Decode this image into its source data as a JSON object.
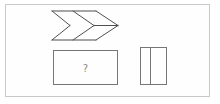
{
  "panel": {
    "background": "#fefefe",
    "frame_color": "#c9c9c9"
  },
  "colors": {
    "chevron_stroke": "#4f4f4f",
    "rectangle_stroke": "#767676",
    "question_color": "#8a8a8a"
  },
  "puzzle": {
    "question_label": "?",
    "shapes": [
      {
        "name": "double-chevron-arrow",
        "description": "wireframe right-pointing double chevron arrow with notched tail and mid line to tip",
        "position": "top-center"
      },
      {
        "name": "question-rectangle",
        "description": "empty rectangle containing a question mark",
        "label": "?",
        "position": "bottom-left"
      },
      {
        "name": "divided-rectangle",
        "description": "small rectangle split by one vertical line into two cells",
        "cells": 2,
        "position": "bottom-right"
      }
    ]
  }
}
